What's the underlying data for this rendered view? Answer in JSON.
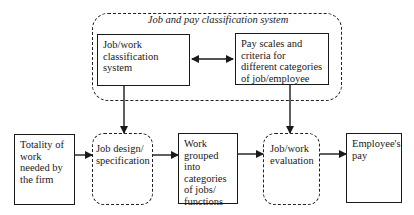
{
  "diagram": {
    "group": {
      "title": "Job and pay classification system",
      "boxes": [
        {
          "id": "job-work-classification",
          "label": "Job/work classification system"
        },
        {
          "id": "pay-scales",
          "label": "Pay scales and criteria for different categories of job/employee"
        }
      ],
      "connector": "bidirectional"
    },
    "flow": [
      {
        "id": "totality-of-work",
        "label": "Totality of work needed by the firm",
        "style": "solid"
      },
      {
        "id": "job-design",
        "label": "Job design/ specification",
        "style": "dashed"
      },
      {
        "id": "work-grouped",
        "label": "Work grouped into categories of jobs/ functions",
        "style": "solid"
      },
      {
        "id": "job-evaluation",
        "label": "Job/work evaluation",
        "style": "dashed"
      },
      {
        "id": "employees-pay",
        "label": "Employee's pay",
        "style": "solid"
      }
    ],
    "edges": [
      {
        "from": "job-work-classification",
        "to": "job-design"
      },
      {
        "from": "pay-scales",
        "to": "job-evaluation"
      },
      {
        "from": "totality-of-work",
        "to": "job-design"
      },
      {
        "from": "job-design",
        "to": "work-grouped"
      },
      {
        "from": "work-grouped",
        "to": "job-evaluation"
      },
      {
        "from": "job-evaluation",
        "to": "employees-pay"
      }
    ],
    "colors": {
      "line": "#1a1a1a",
      "background": "#ffffff"
    }
  }
}
